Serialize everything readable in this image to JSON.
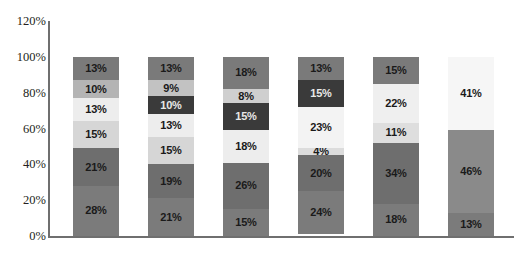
{
  "chart_data": {
    "type": "bar",
    "subtype": "stacked-100-percent",
    "title": "",
    "subtitle": "",
    "xlabel": "",
    "ylabel": "",
    "ylim": [
      0,
      120
    ],
    "y_ticks": [
      "0%",
      "20%",
      "40%",
      "60%",
      "80%",
      "100%",
      "120%"
    ],
    "y_tick_values": [
      0,
      20,
      40,
      60,
      80,
      100,
      120
    ],
    "grid": false,
    "legend": "none",
    "categories": [
      "",
      "",
      "",
      "",
      "",
      ""
    ],
    "orientation": "vertical",
    "stack_order": "bottom-to-top",
    "bars": [
      {
        "index": 1,
        "total": 100,
        "segments": [
          {
            "label": "28%",
            "value": 28,
            "color": "#7b7b7b",
            "text_color": "dark"
          },
          {
            "label": "21%",
            "value": 21,
            "color": "#6e6e6e",
            "text_color": "dark"
          },
          {
            "label": "15%",
            "value": 15,
            "color": "#d6d6d6",
            "text_color": "dark"
          },
          {
            "label": "13%",
            "value": 13,
            "color": "#ededed",
            "text_color": "dark"
          },
          {
            "label": "10%",
            "value": 10,
            "color": "#b4b4b4",
            "text_color": "dark"
          },
          {
            "label": "13%",
            "value": 13,
            "color": "#7a7a7a",
            "text_color": "dark"
          }
        ]
      },
      {
        "index": 2,
        "total": 100,
        "segments": [
          {
            "label": "21%",
            "value": 21,
            "color": "#7b7b7b",
            "text_color": "dark"
          },
          {
            "label": "19%",
            "value": 19,
            "color": "#6e6e6e",
            "text_color": "dark"
          },
          {
            "label": "15%",
            "value": 15,
            "color": "#d6d6d6",
            "text_color": "dark"
          },
          {
            "label": "13%",
            "value": 13,
            "color": "#ededed",
            "text_color": "dark"
          },
          {
            "label": "10%",
            "value": 10,
            "color": "#3a3a3a",
            "text_color": "light"
          },
          {
            "label": "9%",
            "value": 9,
            "color": "#c2c2c2",
            "text_color": "dark"
          },
          {
            "label": "13%",
            "value": 13,
            "color": "#7a7a7a",
            "text_color": "dark"
          }
        ]
      },
      {
        "index": 3,
        "total": 100,
        "segments": [
          {
            "label": "15%",
            "value": 15,
            "color": "#7b7b7b",
            "text_color": "dark"
          },
          {
            "label": "26%",
            "value": 26,
            "color": "#6e6e6e",
            "text_color": "dark"
          },
          {
            "label": "18%",
            "value": 18,
            "color": "#ededed",
            "text_color": "dark"
          },
          {
            "label": "15%",
            "value": 15,
            "color": "#3a3a3a",
            "text_color": "light"
          },
          {
            "label": "8%",
            "value": 8,
            "color": "#cfcfcf",
            "text_color": "dark"
          },
          {
            "label": "18%",
            "value": 18,
            "color": "#7a7a7a",
            "text_color": "dark"
          }
        ]
      },
      {
        "index": 4,
        "total": 100,
        "segments": [
          {
            "label": "24%",
            "value": 24,
            "color": "#7b7b7b",
            "text_color": "dark"
          },
          {
            "label": "20%",
            "value": 20,
            "color": "#6e6e6e",
            "text_color": "dark"
          },
          {
            "label": "4%",
            "value": 4,
            "color": "#dcdcdc",
            "text_color": "dark"
          },
          {
            "label": "23%",
            "value": 23,
            "color": "#f3f3f3",
            "text_color": "dark"
          },
          {
            "label": "15%",
            "value": 15,
            "color": "#3a3a3a",
            "text_color": "light"
          },
          {
            "label": "13%",
            "value": 13,
            "color": "#7a7a7a",
            "text_color": "dark"
          }
        ]
      },
      {
        "index": 5,
        "total": 100,
        "segments": [
          {
            "label": "18%",
            "value": 18,
            "color": "#7b7b7b",
            "text_color": "dark"
          },
          {
            "label": "34%",
            "value": 34,
            "color": "#6e6e6e",
            "text_color": "dark"
          },
          {
            "label": "11%",
            "value": 11,
            "color": "#dedede",
            "text_color": "dark"
          },
          {
            "label": "22%",
            "value": 22,
            "color": "#efefef",
            "text_color": "dark"
          },
          {
            "label": "15%",
            "value": 15,
            "color": "#7a7a7a",
            "text_color": "dark"
          }
        ]
      },
      {
        "index": 6,
        "total": 100,
        "segments": [
          {
            "label": "13%",
            "value": 13,
            "color": "#7b7b7b",
            "text_color": "dark"
          },
          {
            "label": "46%",
            "value": 46,
            "color": "#8a8a8a",
            "text_color": "dark"
          },
          {
            "label": "41%",
            "value": 41,
            "color": "#f6f6f6",
            "text_color": "dark"
          }
        ]
      }
    ]
  },
  "colors": {
    "axis": "#6f6f6f",
    "tick_text": "#231f20",
    "background": "#ffffff",
    "segment_label_dark": "#1a1a1a",
    "segment_label_light": "#e8e8e8"
  }
}
